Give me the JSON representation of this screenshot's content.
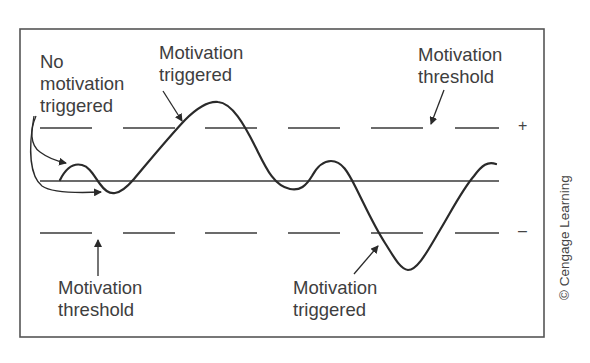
{
  "figure": {
    "labels": {
      "no_motivation": [
        "No",
        "motivation",
        "triggered"
      ],
      "triggered_top": [
        "Motivation",
        "triggered"
      ],
      "threshold_top": [
        "Motivation",
        "threshold"
      ],
      "threshold_bottom": [
        "Motivation",
        "threshold"
      ],
      "triggered_bottom": [
        "Motivation",
        "triggered"
      ]
    },
    "signs": {
      "plus": "+",
      "minus": "–"
    },
    "credit": "© Cengage Learning",
    "colors": {
      "line": "#2a2a2a",
      "frame": "#555555",
      "text": "#3e3e3e"
    },
    "lines": {
      "upper_threshold_y": 128,
      "baseline_y": 181,
      "lower_threshold_y": 233
    }
  }
}
